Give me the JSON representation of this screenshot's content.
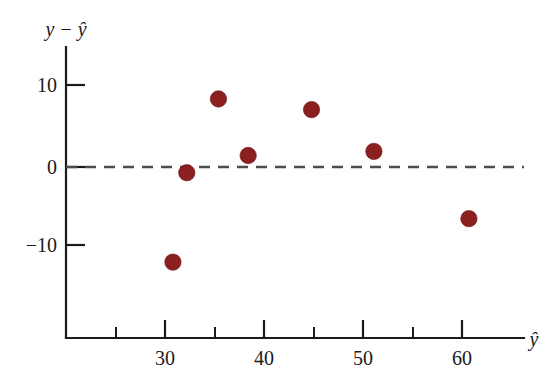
{
  "chart_data": {
    "type": "scatter",
    "title": "",
    "subtitle": "",
    "xlabel": "ŷ",
    "ylabel": "y − ŷ",
    "xlim": [
      22,
      66
    ],
    "ylim": [
      -18.5,
      13.5
    ],
    "grid": false,
    "legend": null,
    "x_ticks_major": [
      30,
      40,
      50,
      60
    ],
    "x_tick_labels": [
      "30",
      "40",
      "50",
      "60"
    ],
    "x_ticks_minor": [
      25,
      35,
      45,
      55
    ],
    "y_ticks_major": [
      10,
      0,
      -10
    ],
    "y_tick_labels": [
      "10",
      "0",
      "−10"
    ],
    "annotations": [
      {
        "name": "zero-reference-line",
        "type": "hline",
        "y": 0,
        "style": "dashed",
        "color": "#4d4d4d"
      }
    ],
    "series": [
      {
        "name": "residuals",
        "color": "#8c1f1f",
        "marker": "circle",
        "points": [
          {
            "x": 30.8,
            "y": -11.6
          },
          {
            "x": 32.2,
            "y": -0.7
          },
          {
            "x": 35.4,
            "y": 8.3
          },
          {
            "x": 38.4,
            "y": 1.4
          },
          {
            "x": 44.8,
            "y": 7.0
          },
          {
            "x": 51.1,
            "y": 1.9
          },
          {
            "x": 60.7,
            "y": -6.3
          }
        ]
      }
    ]
  },
  "axis_labels": {
    "y_axis_title": "y − ŷ",
    "x_axis_title": "ŷ"
  }
}
